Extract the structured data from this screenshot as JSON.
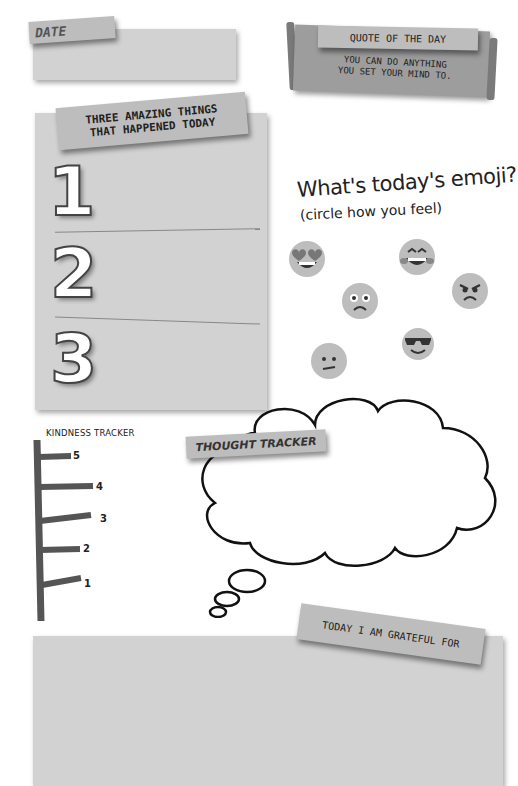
{
  "date_section": {
    "label": "DATE"
  },
  "quote_section": {
    "header": "QUOTE OF THE DAY",
    "line1": "YOU CAN DO ANYTHING",
    "line2": "YOU SET YOUR MIND TO."
  },
  "amazing_things": {
    "title_line1": "THREE AMAZING THINGS",
    "title_line2": "THAT HAPPENED TODAY",
    "items": [
      {
        "number": "1"
      },
      {
        "number": "2"
      },
      {
        "number": "3"
      }
    ]
  },
  "emoji_section": {
    "title": "What's today's emoji?",
    "subtitle": "(circle how you feel)",
    "emojis": [
      {
        "name": "heart-eyes"
      },
      {
        "name": "laughing"
      },
      {
        "name": "angry"
      },
      {
        "name": "worried"
      },
      {
        "name": "cool-sunglasses"
      },
      {
        "name": "confused"
      }
    ]
  },
  "kindness_tracker": {
    "title": "KINDNESS TRACKER",
    "levels": [
      "5",
      "4",
      "3",
      "2",
      "1"
    ]
  },
  "thought_tracker": {
    "label": "THOUGHT TRACKER"
  },
  "grateful_section": {
    "label": "TODAY I AM GRATEFUL FOR"
  },
  "colors": {
    "paper": "#d2d2d2",
    "tape": "#bdbdbd",
    "scroll": "#9d9d9d",
    "ink": "#222222"
  }
}
